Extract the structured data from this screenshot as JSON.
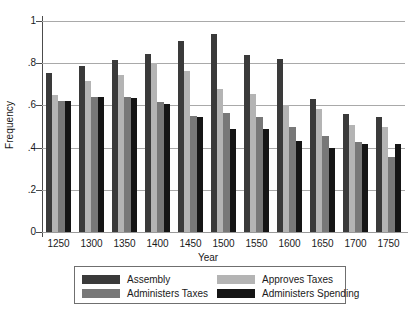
{
  "chart_data": {
    "type": "bar",
    "title": "",
    "xlabel": "Year",
    "ylabel": "Frequency",
    "categories": [
      "1250",
      "1300",
      "1350",
      "1400",
      "1450",
      "1500",
      "1550",
      "1600",
      "1650",
      "1700",
      "1750"
    ],
    "ylim": [
      0,
      1
    ],
    "yticks": [
      0,
      0.2,
      0.4,
      0.6,
      0.8,
      1
    ],
    "ytick_labels": [
      "0",
      ".2",
      ".4",
      ".6",
      ".8",
      "1"
    ],
    "grid": "horizontal",
    "legend_position": "below-axes",
    "series": [
      {
        "name": "Assembly",
        "color": "#3a3a3a",
        "values": [
          0.755,
          0.785,
          0.815,
          0.845,
          0.905,
          0.94,
          0.84,
          0.82,
          0.63,
          0.56,
          0.545
        ]
      },
      {
        "name": "Approves Taxes",
        "color": "#b4b4b4",
        "values": [
          0.65,
          0.715,
          0.745,
          0.8,
          0.765,
          0.68,
          0.655,
          0.6,
          0.585,
          0.505,
          0.5
        ]
      },
      {
        "name": "Administers Taxes",
        "color": "#787878",
        "values": [
          0.62,
          0.64,
          0.64,
          0.615,
          0.55,
          0.565,
          0.545,
          0.5,
          0.455,
          0.425,
          0.355
        ]
      },
      {
        "name": "Administers Spending",
        "color": "#151515",
        "values": [
          0.62,
          0.64,
          0.635,
          0.605,
          0.545,
          0.49,
          0.49,
          0.43,
          0.4,
          0.415,
          0.415
        ]
      }
    ]
  }
}
